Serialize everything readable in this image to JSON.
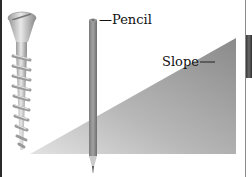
{
  "labels": {
    "pencil": "—Pencil",
    "slope": "Slope"
  },
  "objects": {
    "screw": "screw-illustration",
    "pencil": "pencil-illustration",
    "slope": "right-triangle-slope"
  },
  "colors": {
    "slope_dark": "#8e8e8e",
    "slope_light": "#d6d6d6",
    "pencil_body": "#8f8f8f",
    "screw_metal": "#c8c8c8"
  }
}
